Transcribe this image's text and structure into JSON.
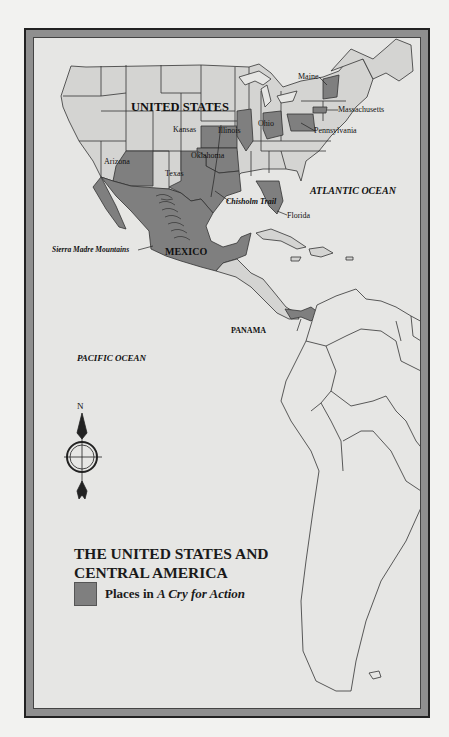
{
  "map": {
    "title_line1": "THE UNITED STATES AND",
    "title_line2": "CENTRAL AMERICA",
    "legend": {
      "label_prefix": "Places in ",
      "label_italic": "A Cry for Action",
      "swatch_color": "#7f7f7f"
    },
    "colors": {
      "highlight": "#7f7f7f",
      "land": "#d4d4d2",
      "water": "#e6e6e4",
      "border": "#333333"
    },
    "labels": {
      "country_us": "UNITED STATES",
      "country_mexico": "MEXICO",
      "country_panama": "PANAMA",
      "ocean_atlantic": "ATLANTIC OCEAN",
      "ocean_pacific": "PACIFIC OCEAN",
      "mountains": "Sierra Madre Mountains",
      "trail": "Chisholm Trail",
      "states": {
        "kansas": "Kansas",
        "illinois": "Illinois",
        "ohio": "Ohio",
        "oklahoma": "Oklahoma",
        "arizona": "Arizona",
        "texas": "Texas",
        "florida": "Florida",
        "maine": "Maine",
        "massachusetts": "Massachusetts",
        "pennsylvania": "Pennsylvania"
      }
    },
    "compass": {
      "north_label": "N"
    },
    "highlighted_places": [
      "Arizona",
      "Kansas",
      "Oklahoma",
      "Texas",
      "Illinois",
      "Ohio",
      "Pennsylvania",
      "Massachusetts",
      "Maine",
      "Florida",
      "Mexico",
      "Panama"
    ]
  }
}
